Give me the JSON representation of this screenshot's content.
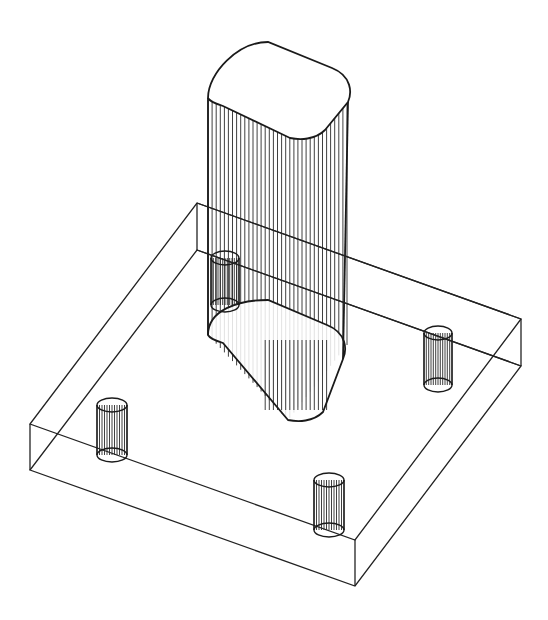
{
  "figure": {
    "line_color": "#222222",
    "background": "#ffffff"
  },
  "plate": {
    "top": [
      [
        197,
        203
      ],
      [
        521,
        319
      ],
      [
        355,
        540
      ],
      [
        30,
        424
      ]
    ],
    "bottom": [
      [
        197,
        250
      ],
      [
        521,
        366
      ],
      [
        355,
        586
      ],
      [
        30,
        470
      ]
    ]
  },
  "column": {
    "top_face": {
      "left": [
        208,
        98
      ],
      "back": [
        268,
        42
      ],
      "right": [
        352,
        88
      ],
      "front": [
        290,
        138
      ]
    },
    "bottom_face": {
      "left": [
        208,
        335
      ],
      "back": [
        268,
        300
      ],
      "right": [
        347,
        345
      ],
      "front": [
        288,
        420
      ]
    },
    "hatch_count": 34
  },
  "pins": [
    {
      "name": "back-left",
      "cx": 225,
      "top": 258,
      "bottom": 305,
      "rx": 14,
      "ry": 7
    },
    {
      "name": "right",
      "cx": 438,
      "top": 333,
      "bottom": 385,
      "rx": 14,
      "ry": 7
    },
    {
      "name": "left",
      "cx": 112,
      "top": 405,
      "bottom": 455,
      "rx": 15,
      "ry": 7
    },
    {
      "name": "front",
      "cx": 329,
      "top": 480,
      "bottom": 530,
      "rx": 15,
      "ry": 7
    }
  ]
}
